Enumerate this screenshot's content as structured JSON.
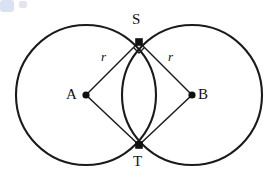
{
  "figure": {
    "background_color": "#ffffff",
    "stroke_color": "#1a1a1a",
    "labels": {
      "point_s": "S",
      "point_t": "T",
      "point_a": "A",
      "point_b": "B",
      "radius_left": "r",
      "radius_right": "r"
    },
    "artifact": {
      "name": "blue-corner-artifact",
      "color": "#c3cfea"
    }
  },
  "chart_data": {
    "type": "diagram",
    "subtype": "geometry-construction",
    "title": "",
    "xlabel": "",
    "ylabel": "",
    "coordinate_space": {
      "width": 269,
      "height": 188,
      "units": "px"
    },
    "circles": [
      {
        "name": "circle-A",
        "center_label": "A",
        "cx": 86,
        "cy": 95,
        "r": 70,
        "stroke": "#1a1a1a",
        "stroke_width": 2.1,
        "fill": "none"
      },
      {
        "name": "circle-B",
        "center_label": "B",
        "cx": 192,
        "cy": 95,
        "r": 70,
        "stroke": "#1a1a1a",
        "stroke_width": 2.1,
        "fill": "none"
      }
    ],
    "points": [
      {
        "label": "A",
        "x": 86,
        "y": 95,
        "marker": "filled-dot",
        "radius": 3.6,
        "label_position": "left"
      },
      {
        "label": "B",
        "x": 192,
        "y": 95,
        "marker": "filled-dot",
        "radius": 3.6,
        "label_position": "right"
      },
      {
        "label": "S",
        "x": 139,
        "y": 42,
        "marker": "filled-dot",
        "radius": 3.8,
        "label_position": "above"
      },
      {
        "label": "T",
        "x": 139,
        "y": 145,
        "marker": "filled-dot",
        "radius": 3.8,
        "label_position": "below"
      }
    ],
    "segments": [
      {
        "name": "AS",
        "from": "A",
        "to": "S",
        "x1": 86,
        "y1": 95,
        "x2": 139,
        "y2": 42,
        "label": "r",
        "stroke_width": 1.5
      },
      {
        "name": "BS",
        "from": "B",
        "to": "S",
        "x1": 192,
        "y1": 95,
        "x2": 139,
        "y2": 42,
        "label": "r",
        "stroke_width": 1.5
      },
      {
        "name": "AT",
        "from": "A",
        "to": "T",
        "x1": 86,
        "y1": 95,
        "x2": 139,
        "y2": 145,
        "label": "",
        "stroke_width": 1.5
      },
      {
        "name": "BT",
        "from": "B",
        "to": "T",
        "x1": 192,
        "y1": 95,
        "x2": 139,
        "y2": 145,
        "label": "",
        "stroke_width": 1.5
      }
    ],
    "angle_markers": [
      {
        "name": "right-angle-at-S",
        "at_point": "S",
        "x": 139,
        "y": 42,
        "type": "right-angle-square",
        "size": 11,
        "orientation": "downward"
      }
    ],
    "annotations": [
      {
        "text": "r",
        "x": 105,
        "y": 57,
        "style": "italic",
        "refers_to": "AS"
      },
      {
        "text": "r",
        "x": 172,
        "y": 57,
        "style": "italic",
        "refers_to": "BS"
      },
      {
        "text": "S",
        "x": 139,
        "y": 20,
        "style": "roman",
        "refers_to": "upper intersection point"
      },
      {
        "text": "T",
        "x": 139,
        "y": 162,
        "style": "roman",
        "refers_to": "lower intersection point"
      },
      {
        "text": "A",
        "x": 72,
        "y": 95,
        "style": "roman",
        "refers_to": "left circle center"
      },
      {
        "text": "B",
        "x": 204,
        "y": 95,
        "style": "roman",
        "refers_to": "right circle center"
      }
    ],
    "legend": [],
    "grid": false
  }
}
